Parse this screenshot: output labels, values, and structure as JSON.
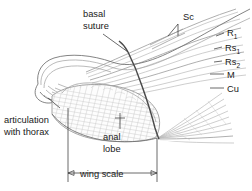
{
  "figure": {
    "background_color": "#ffffff",
    "line_color": "#6e6e6e",
    "vein_color": "#b9b9b9",
    "suture_color": "#4a4a4a",
    "text_color": "#1a1a1a"
  },
  "labels": {
    "basal_suture_line1": "basal",
    "basal_suture_line2": "suture",
    "articulation_line1": "articulation",
    "articulation_line2": "with thorax",
    "anal_lobe_line1": "anal",
    "anal_lobe_line2": "lobe",
    "wing_scale": "wing scale"
  },
  "veins": [
    {
      "name": "Sc",
      "base": "Sc",
      "sub": ""
    },
    {
      "name": "R1",
      "base": "R",
      "sub": "1"
    },
    {
      "name": "Rs1",
      "base": "Rs",
      "sub": "1"
    },
    {
      "name": "Rs2",
      "base": "Rs",
      "sub": "2"
    },
    {
      "name": "M",
      "base": "M",
      "sub": ""
    },
    {
      "name": "Cu",
      "base": "Cu",
      "sub": ""
    }
  ]
}
